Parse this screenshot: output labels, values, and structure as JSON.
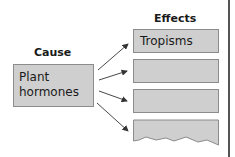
{
  "diagram": {
    "cause": {
      "title": "Cause",
      "box_text_line1": "Plant",
      "box_text_line2": "hormones"
    },
    "effects": {
      "title": "Effects",
      "items": [
        {
          "label": "Tropisms"
        },
        {
          "label": ""
        },
        {
          "label": ""
        },
        {
          "label": ""
        }
      ]
    },
    "colors": {
      "box_fill": "#cfcfcf",
      "box_border": "#8c8c8c",
      "arrow": "#333333"
    }
  }
}
